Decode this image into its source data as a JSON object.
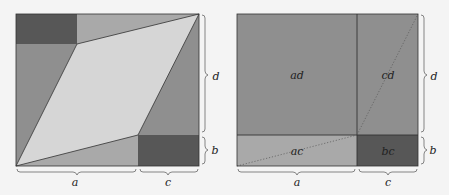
{
  "colors": {
    "background": "#f4f4f4",
    "dark": "#575757",
    "mid": "#8f8f8f",
    "light_mid": "#a9a9a9",
    "parallelogram": "#d6d6d6",
    "stroke": "#333333"
  },
  "left_figure": {
    "description": "Rectangle of width a+c and height b+d containing a parallelogram",
    "labels": {
      "bottom_left_span": "a",
      "bottom_right_span": "c",
      "right_upper_span": "d",
      "right_lower_span": "b"
    }
  },
  "right_figure": {
    "description": "Rectangle decomposed into four areas",
    "regions": {
      "top_left": "ad",
      "top_right": "cd",
      "bottom_left": "ac",
      "bottom_right": "bc"
    },
    "labels": {
      "bottom_left_span": "a",
      "bottom_right_span": "c",
      "right_upper_span": "d",
      "right_lower_span": "b"
    }
  }
}
